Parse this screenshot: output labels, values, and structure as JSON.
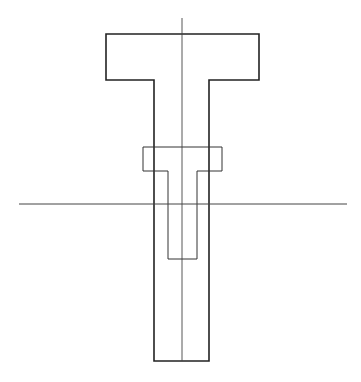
{
  "diagram": {
    "type": "technical-drawing",
    "colors": {
      "background": "#ffffff",
      "outline": "#222222",
      "thin_line": "#444444"
    },
    "outer_t": {
      "points": "106,34 259,34 259,80 209,80 209,361 154,361 154,80 106,80"
    },
    "inner_t": {
      "points": "143,147 222,147 222,171 197,171 197,259 168,259 168,171 143,171"
    },
    "vertical_axis": {
      "x1": 182,
      "y1": 18,
      "x2": 182,
      "y2": 361
    },
    "horizontal_axis": {
      "x1": 19,
      "y1": 204,
      "x2": 347,
      "y2": 204
    }
  }
}
